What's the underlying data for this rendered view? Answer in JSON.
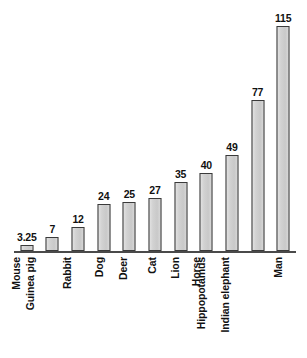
{
  "chart_data": {
    "type": "bar",
    "title": "",
    "subtitle": "",
    "xlabel": "",
    "ylabel": "",
    "categories": [
      "Mouse",
      "Guinea pig",
      "Rabbit",
      "Dog",
      "Deer",
      "Cat",
      "Lion",
      "Horse",
      "Hippopotamus",
      "Indian elephant",
      "Man"
    ],
    "values": [
      3.25,
      7,
      12,
      24,
      25,
      27,
      35,
      40,
      49,
      77,
      115
    ],
    "value_labels": [
      "3.25",
      "7",
      "12",
      "24",
      "25",
      "27",
      "35",
      "40",
      "49",
      "77",
      "115"
    ],
    "ylim": [
      0,
      124
    ],
    "grid": false,
    "legend": null,
    "legend_position": "none",
    "axis_visible": {
      "x_baseline": true,
      "y_axis": false,
      "ticks": false
    },
    "tick_labels": [],
    "annotations": [],
    "orientation": "vertical",
    "category_label_rotation": -90,
    "colors": {
      "bar_fill": "#cfcfcf",
      "bar_border": "#3a3a3a",
      "axis": "#4a4a4a",
      "text": "#111111",
      "background": "#ffffff"
    }
  }
}
